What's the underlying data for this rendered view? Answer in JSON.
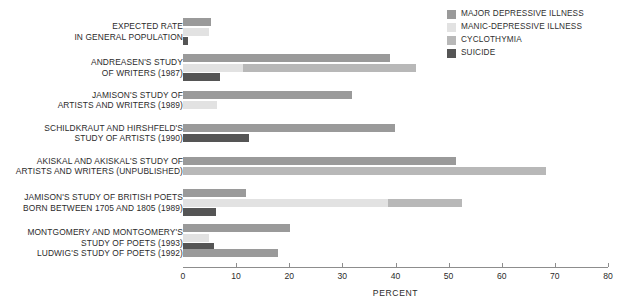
{
  "chart_data": {
    "type": "bar",
    "orientation": "horizontal",
    "title": "",
    "xlabel": "PERCENT",
    "ylabel": "",
    "xlim": [
      0,
      80
    ],
    "xticks": [
      0,
      10,
      20,
      30,
      40,
      50,
      60,
      70,
      80
    ],
    "grid": false,
    "legend_position": "top-right",
    "series": [
      {
        "name": "MAJOR DEPRESSIVE ILLNESS",
        "color": "#9a9a9a",
        "values": [
          5.2,
          38.9,
          31.8,
          39.9,
          51.3,
          11.8,
          20.1,
          17.9
        ]
      },
      {
        "name": "MANIC-DEPRESSIVE ILLNESS",
        "color": "#e2e2e2",
        "values": [
          4.8,
          11.3,
          6.4,
          0,
          0,
          38.6,
          4.8,
          0
        ]
      },
      {
        "name": "CYCLOTHYMIA",
        "color": "#b8b8b8",
        "values": [
          0,
          43.8,
          0,
          0,
          68.3,
          52.5,
          0,
          0
        ]
      },
      {
        "name": "SUICIDE",
        "color": "#555555",
        "values": [
          1.0,
          6.9,
          0,
          12.4,
          0,
          6.2,
          5.9,
          0
        ]
      }
    ],
    "categories": [
      "EXPECTED RATE\nIN GENERAL POPULATION",
      "ANDREASEN'S STUDY\nOF WRITERS (1987)",
      "JAMISON'S STUDY OF\nARTISTS AND WRITERS (1989)",
      "SCHILDKRAUT AND HIRSHFELD'S\nSTUDY OF ARTISTS (1990)",
      "AKISKAL AND AKISKAL'S STUDY OF\nARTISTS AND WRITERS (UNPUBLISHED)",
      "JAMISON'S STUDY OF BRITISH POETS\nBORN BETWEEN 1705 AND 1805 (1989)",
      "MONTGOMERY AND MONTGOMERY'S\nSTUDY OF POETS (1993)",
      "LUDWIG'S STUDY OF POETS (1992)"
    ]
  },
  "legend": {
    "items": [
      {
        "label": "MAJOR DEPRESSIVE ILLNESS",
        "color": "#9a9a9a"
      },
      {
        "label": "MANIC-DEPRESSIVE ILLNESS",
        "color": "#e2e2e2"
      },
      {
        "label": "CYCLOTHYMIA",
        "color": "#b8b8b8"
      },
      {
        "label": "SUICIDE",
        "color": "#555555"
      }
    ]
  },
  "axis": {
    "title": "PERCENT",
    "tick_labels": [
      "0",
      "10",
      "20",
      "30",
      "40",
      "50",
      "60",
      "70",
      "80"
    ]
  },
  "groups": [
    {
      "label": "EXPECTED RATE\nIN GENERAL POPULATION",
      "rows": [
        {
          "series": "MAJOR DEPRESSIVE ILLNESS",
          "start": 0,
          "end": 5.2
        },
        {
          "series": "MANIC-DEPRESSIVE ILLNESS",
          "start": 0,
          "end": 4.8
        },
        {
          "series": "SUICIDE",
          "start": 0,
          "end": 1.0
        }
      ]
    },
    {
      "label": "ANDREASEN'S STUDY\nOF WRITERS (1987)",
      "rows": [
        {
          "series": "MAJOR DEPRESSIVE ILLNESS",
          "start": 0,
          "end": 38.9
        },
        {
          "series": "MANIC-DEPRESSIVE ILLNESS",
          "start": 0,
          "end": 11.3
        },
        {
          "series": "CYCLOTHYMIA",
          "start": 11.3,
          "end": 43.8
        },
        {
          "series": "SUICIDE",
          "start": 0,
          "end": 6.9
        }
      ]
    },
    {
      "label": "JAMISON'S STUDY OF\nARTISTS AND WRITERS (1989)",
      "rows": [
        {
          "series": "MAJOR DEPRESSIVE ILLNESS",
          "start": 0,
          "end": 31.8
        },
        {
          "series": "MANIC-DEPRESSIVE ILLNESS",
          "start": 0,
          "end": 6.4
        }
      ]
    },
    {
      "label": "SCHILDKRAUT AND HIRSHFELD'S\nSTUDY OF ARTISTS (1990)",
      "rows": [
        {
          "series": "MAJOR DEPRESSIVE ILLNESS",
          "start": 0,
          "end": 39.9
        },
        {
          "series": "SUICIDE",
          "start": 0,
          "end": 12.4
        }
      ]
    },
    {
      "label": "AKISKAL AND AKISKAL'S STUDY OF\nARTISTS AND WRITERS (UNPUBLISHED)",
      "rows": [
        {
          "series": "MAJOR DEPRESSIVE ILLNESS",
          "start": 0,
          "end": 51.3
        },
        {
          "series": "CYCLOTHYMIA",
          "start": 0,
          "end": 68.3
        }
      ]
    },
    {
      "label": "JAMISON'S STUDY OF BRITISH POETS\nBORN BETWEEN 1705 AND 1805 (1989)",
      "rows": [
        {
          "series": "MAJOR DEPRESSIVE ILLNESS",
          "start": 0,
          "end": 11.8
        },
        {
          "series": "MANIC-DEPRESSIVE ILLNESS",
          "start": 0,
          "end": 38.6
        },
        {
          "series": "CYCLOTHYMIA",
          "start": 38.6,
          "end": 52.5
        },
        {
          "series": "SUICIDE",
          "start": 0,
          "end": 6.2
        }
      ]
    },
    {
      "label": "MONTGOMERY AND MONTGOMERY'S\nSTUDY OF POETS (1993)",
      "rows": [
        {
          "series": "MAJOR DEPRESSIVE ILLNESS",
          "start": 0,
          "end": 20.1
        },
        {
          "series": "MANIC-DEPRESSIVE ILLNESS",
          "start": 0,
          "end": 4.8
        },
        {
          "series": "SUICIDE",
          "start": 0,
          "end": 5.9
        }
      ]
    },
    {
      "label": "LUDWIG'S STUDY OF POETS (1992)",
      "rows": [
        {
          "series": "MAJOR DEPRESSIVE ILLNESS",
          "start": 0,
          "end": 17.9
        }
      ]
    }
  ]
}
